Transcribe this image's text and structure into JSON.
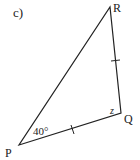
{
  "part_label": "c)",
  "vertices": {
    "P": {
      "label": "P",
      "x": 19,
      "y": 145
    },
    "Q": {
      "label": "Q",
      "x": 121,
      "y": 113
    },
    "R": {
      "label": "R",
      "x": 110,
      "y": 7
    }
  },
  "angles": {
    "P": "40°",
    "Q": "z"
  },
  "tick_marks": [
    "PQ",
    "QR"
  ],
  "colors": {
    "line": "#222222",
    "text": "#222222"
  }
}
